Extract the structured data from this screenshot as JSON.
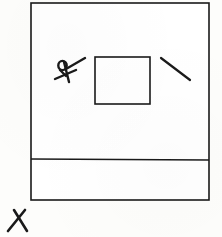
{
  "document": {
    "kind": "hand-drawn-sketch",
    "title": "Hand-drawn floor plan sketch",
    "width": 222,
    "height": 237,
    "background_color": "#fdfdfb",
    "ink_color": "#1a1a1a"
  },
  "diagram": {
    "outer_frame": {
      "label": "outer boundary rectangle",
      "x": 31,
      "y": 3,
      "width": 178,
      "height": 197,
      "stroke_width": 1.6,
      "fill": "#ffffff"
    },
    "divider_line": {
      "label": "horizontal divider near bottom",
      "x1": 31,
      "y1": 159,
      "x2": 209,
      "y2": 160,
      "stroke_width": 1.4
    },
    "inner_square": {
      "label": "inner square",
      "x": 95,
      "y": 57,
      "width": 55,
      "height": 47,
      "stroke_width": 1.6,
      "fill": "#ffffff"
    },
    "right_diagonal": {
      "label": "short diagonal stroke upper right",
      "x1": 161,
      "y1": 58,
      "x2": 190,
      "y2": 80,
      "stroke_width": 2.2
    },
    "figure_glyph": {
      "label": "hand-drawn figure with loop head and crossing strokes",
      "head_cx": 62.5,
      "head_cy": 65.5,
      "head_rx": 4.2,
      "head_ry": 4.6,
      "stroke_width": 2.4,
      "strokes": [
        {
          "name": "upper-diagonal",
          "x1": 66,
          "y1": 69,
          "x2": 85,
          "y2": 58
        },
        {
          "name": "lower-diagonal",
          "x1": 55,
          "y1": 79,
          "x2": 76,
          "y2": 70
        },
        {
          "name": "body-stem",
          "x1": 64,
          "y1": 62,
          "x2": 69,
          "y2": 82
        },
        {
          "name": "head-tail",
          "x1": 60,
          "y1": 70,
          "x2": 66,
          "y2": 76
        }
      ]
    },
    "corner_glyph": {
      "label": "lambda mark outside lower left corner",
      "strokes": [
        {
          "name": "left-stroke",
          "x1": 8,
          "y1": 231,
          "x2": 25,
          "y2": 210
        },
        {
          "name": "right-stroke",
          "x1": 14,
          "y1": 210,
          "x2": 27,
          "y2": 231
        }
      ],
      "stroke_width": 2.6
    }
  },
  "regions": {
    "upper_region_label": "upper room area",
    "lower_band_label": "lower band area"
  }
}
